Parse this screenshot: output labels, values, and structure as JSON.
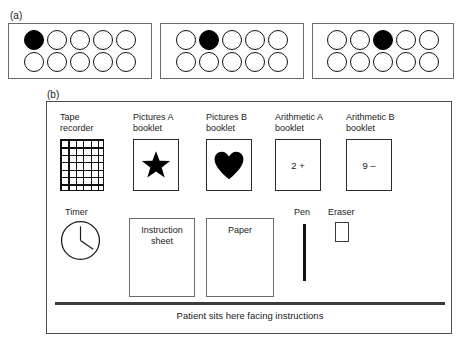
{
  "figure": {
    "panel_a": {
      "label": "(a)",
      "boxes": [
        {
          "rows": [
            [
              "filled",
              "empty",
              "empty",
              "empty",
              "empty"
            ],
            [
              "empty",
              "empty",
              "empty",
              "empty",
              "empty"
            ]
          ]
        },
        {
          "rows": [
            [
              "empty",
              "filled",
              "empty",
              "empty",
              "empty"
            ],
            [
              "empty",
              "empty",
              "empty",
              "empty",
              "empty"
            ]
          ]
        },
        {
          "rows": [
            [
              "empty",
              "empty",
              "filled",
              "empty",
              "empty"
            ],
            [
              "empty",
              "empty",
              "empty",
              "empty",
              "empty"
            ]
          ]
        }
      ]
    },
    "panel_b": {
      "label": "(b)",
      "captions": {
        "tape_recorder": "Tape\nrecorder",
        "pictures_a": "Pictures A\nbooklet",
        "pictures_b": "Pictures B\nbooklet",
        "arithmetic_a": "Arithmetic A\nbooklet",
        "arithmetic_b": "Arithmetic B\nbooklet",
        "timer": "Timer",
        "pen": "Pen",
        "eraser": "Eraser"
      },
      "booklet_contents": {
        "pictures_a_shape": "star-icon",
        "pictures_b_shape": "heart-icon",
        "arithmetic_a_text": "2 +",
        "arithmetic_b_text": "9 –"
      },
      "sheets": {
        "instruction_sheet": "Instruction\nsheet",
        "paper": "Paper"
      },
      "patient_note": "Patient sits here facing instructions"
    }
  },
  "colors": {
    "ink": "#000000",
    "box_border": "#6b6b6b",
    "booklet_border": "#2b2b2b",
    "table_edge": "#3d3d3d",
    "background": "#ffffff"
  }
}
